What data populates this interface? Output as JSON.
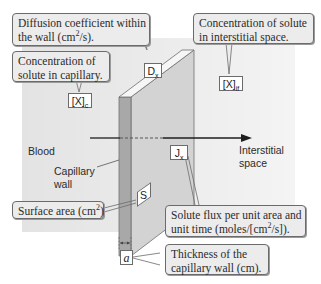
{
  "diagram": {
    "colors": {
      "panel_background": "#e6e6e6",
      "wall_front": "#d2d2d2",
      "wall_edge": "#a9a9a9",
      "wall_top": "#f5f5f5",
      "callout_fill": "#ececec",
      "callout_border": "#6b6b6b",
      "arrow": "#1e1e1e"
    },
    "regions": {
      "left": "Blood",
      "wall": "Capillary wall",
      "wall_line1": "Capillary",
      "wall_line2": "wall",
      "right_line1": "Interstitial",
      "right_line2": "space"
    },
    "symbols": {
      "dx": {
        "base": "D",
        "sub": "x"
      },
      "xc": {
        "base": "[X]",
        "sub": "c"
      },
      "xif": {
        "base": "[X]",
        "sub": "if"
      },
      "jx": {
        "base": "J",
        "sub": "x"
      },
      "s": {
        "base": "S"
      },
      "a": {
        "base": "a"
      }
    },
    "callouts": {
      "diffusion": {
        "line1": "Diffusion coefficient within",
        "line2_pre": "the wall (cm",
        "line2_sup": "2",
        "line2_post": "/s)."
      },
      "capillary_conc": {
        "line1": "Concentration of",
        "line2": "solute in capillary."
      },
      "interstitial_conc": {
        "line1": "Concentration of solute",
        "line2": "in interstitial space."
      },
      "surface_area": {
        "pre": "Surface area (cm",
        "sup": "2",
        "post": ")"
      },
      "flux": {
        "line1": "Solute flux per unit area and",
        "line2_pre": "unit time (moles/[cm",
        "line2_sup": "2",
        "line2_post": "/s])."
      },
      "thickness": {
        "line1": "Thickness of the",
        "line2": "capillary wall (cm)."
      }
    }
  }
}
